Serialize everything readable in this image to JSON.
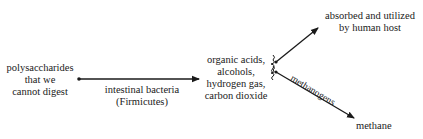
{
  "diagram": {
    "source": {
      "lines": [
        "polysaccharides",
        "that we",
        "cannot digest"
      ]
    },
    "process": {
      "lines": [
        "intestinal bacteria",
        "(Firmicutes)"
      ]
    },
    "products": {
      "lines": [
        "organic acids,",
        "alcohols,",
        "hydrogen gas,",
        "carbon dioxide"
      ]
    },
    "outcome_top": {
      "lines": [
        "absorbed and utilized",
        "by human host"
      ]
    },
    "outcome_bottom": {
      "label": "methane"
    },
    "edge_label_bottom": "methanogens",
    "colors": {
      "text": "#1a1a1a",
      "line": "#1a1a1a",
      "background": "#ffffff"
    }
  }
}
